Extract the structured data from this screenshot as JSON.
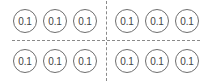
{
  "diagram": {
    "rows": [
      {
        "cells": [
          "0.1",
          "0.1",
          "0.1",
          "0.1",
          "0.1",
          "0.1"
        ]
      },
      {
        "cells": [
          "0.1",
          "0.1",
          "0.1",
          "0.1",
          "0.1",
          "0.1"
        ]
      }
    ],
    "colors": {
      "circle_stroke": "#6e6e6e",
      "text": "#444444",
      "divider": "#8a8a8a"
    }
  }
}
